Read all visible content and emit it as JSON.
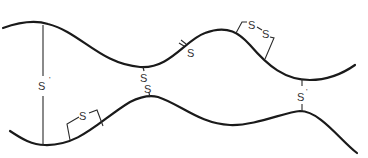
{
  "diagram": {
    "labels": {
      "left_interchain": "S",
      "left_interchain_mark": "'",
      "center_s_top": "S",
      "center_s_bottom": "S",
      "top_single": "S",
      "top_loop_s1": "S",
      "top_loop_dash": "-",
      "top_loop_s2": "S",
      "bottom_loop": "S",
      "right_interchain": "S",
      "right_interchain_mark": "'"
    },
    "colors": {
      "stroke": "#1a1a1a",
      "background": "#ffffff"
    }
  }
}
